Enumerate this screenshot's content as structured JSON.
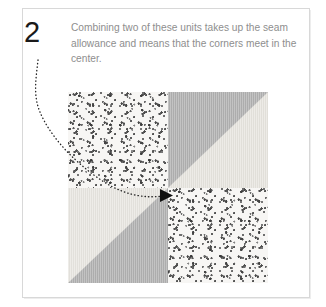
{
  "page": {
    "background_color": "#ffffff",
    "width": 326,
    "height": 307
  },
  "card": {
    "border_color": "#d8d8d8",
    "background_color": "#ffffff"
  },
  "step": {
    "number": "2",
    "instruction": "Combining two of these units takes up the seam allowance and means that the corners meet in the center.",
    "text_color": "#8e8e8e",
    "number_color": "#1a1a1a"
  },
  "annotation": {
    "type": "curved-dotted-pointer",
    "dot_color": "#222222",
    "target": "center of quilt block",
    "arrowhead_color": "#111111"
  },
  "quilt_block": {
    "name": "four-patch-block",
    "rows": 2,
    "columns": 2,
    "colors": {
      "speckle_background": "#f7f6f4",
      "speckle_dots": "#4a4a4a",
      "triangle_gray": "#b2b2b2",
      "triangle_light": "#e8e6e0"
    },
    "quadrants": [
      {
        "position": "top-left",
        "fabric": "speckled",
        "description": "speckled dotted fabric square"
      },
      {
        "position": "top-right",
        "fabric": "half-square-triangle",
        "description": "gray triangle upper-left, light triangle lower-right"
      },
      {
        "position": "bottom-left",
        "fabric": "half-square-triangle",
        "description": "light triangle upper-left, gray triangle lower-right"
      },
      {
        "position": "bottom-right",
        "fabric": "speckled",
        "description": "speckled dotted fabric square"
      }
    ]
  }
}
